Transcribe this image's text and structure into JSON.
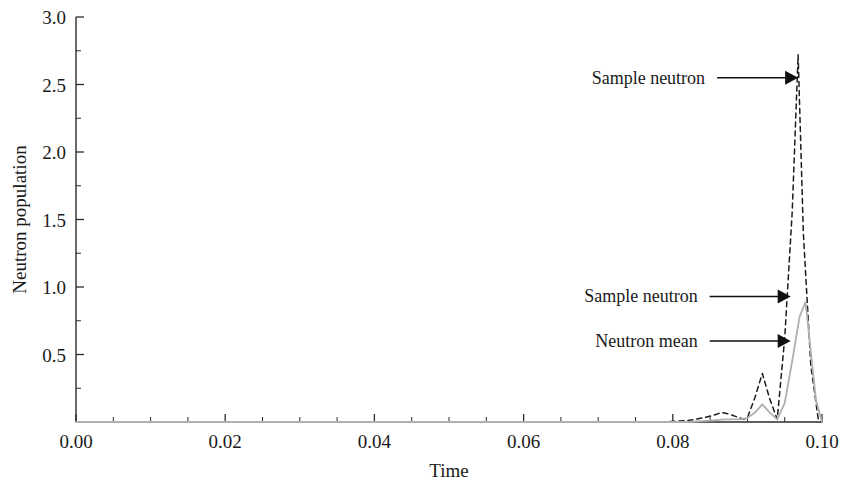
{
  "chart_data": {
    "type": "line",
    "title": "",
    "xlabel": "Time",
    "ylabel": "Neutron population",
    "xlim": [
      0.0,
      0.1
    ],
    "ylim": [
      0.0,
      3.0
    ],
    "grid": false,
    "legend": "none (inline arrow annotations)",
    "x_ticks": [
      0.0,
      0.02,
      0.04,
      0.06,
      0.08,
      0.1
    ],
    "x_tick_labels": [
      "0.00",
      "0.02",
      "0.04",
      "0.06",
      "0.08",
      "0.10"
    ],
    "x_minor_tick_step": 0.005,
    "y_ticks": [
      0.0,
      0.5,
      1.0,
      1.5,
      2.0,
      2.5,
      3.0
    ],
    "y_tick_labels": [
      "0.0",
      "0.5",
      "1.0",
      "1.5",
      "2.0",
      "2.5",
      "3.0"
    ],
    "y_minor_tick_step": 0.25,
    "series": [
      {
        "name": "Sample neutron",
        "style": "dashed",
        "color": "#1c1c1c",
        "x": [
          0.0,
          0.01,
          0.02,
          0.03,
          0.04,
          0.05,
          0.06,
          0.07,
          0.078,
          0.082,
          0.084,
          0.0855,
          0.0865,
          0.0875,
          0.0885,
          0.0895,
          0.09,
          0.091,
          0.092,
          0.093,
          0.094,
          0.095,
          0.096,
          0.0968,
          0.0975,
          0.0985,
          0.0995,
          0.1
        ],
        "y": [
          0.0,
          0.0,
          0.0,
          0.0,
          0.0,
          0.0,
          0.0,
          0.0,
          0.0,
          0.01,
          0.03,
          0.05,
          0.07,
          0.06,
          0.04,
          0.02,
          0.03,
          0.18,
          0.36,
          0.17,
          0.02,
          0.62,
          1.55,
          2.72,
          1.4,
          0.42,
          0.02,
          0.0
        ]
      },
      {
        "name": "Neutron mean",
        "style": "solid",
        "color": "#b0b0b0",
        "x": [
          0.0,
          0.01,
          0.02,
          0.03,
          0.04,
          0.05,
          0.06,
          0.07,
          0.078,
          0.082,
          0.085,
          0.087,
          0.089,
          0.09,
          0.091,
          0.092,
          0.093,
          0.094,
          0.095,
          0.096,
          0.097,
          0.0978,
          0.0985,
          0.0992,
          0.1
        ],
        "y": [
          0.0,
          0.0,
          0.0,
          0.0,
          0.0,
          0.0,
          0.0,
          0.0,
          0.0,
          0.0,
          0.01,
          0.02,
          0.02,
          0.03,
          0.07,
          0.13,
          0.07,
          0.02,
          0.14,
          0.45,
          0.78,
          0.89,
          0.52,
          0.16,
          0.0
        ]
      }
    ],
    "annotations": [
      {
        "label": "Sample neutron",
        "target_x": 0.0968,
        "target_y": 2.55,
        "points_to": "Sample neutron",
        "arrow_direction": "right"
      },
      {
        "label": "Sample neutron",
        "target_x": 0.0958,
        "target_y": 0.93,
        "points_to": "Sample neutron",
        "arrow_direction": "right"
      },
      {
        "label": "Neutron mean",
        "target_x": 0.0958,
        "target_y": 0.6,
        "points_to": "Neutron mean",
        "arrow_direction": "right"
      }
    ]
  }
}
